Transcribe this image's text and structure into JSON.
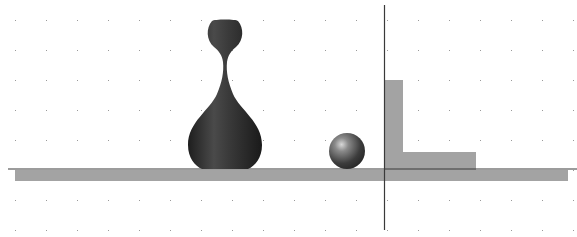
{
  "scene": {
    "title": "3D render viewport: vase and sphere on ground plane",
    "background": "#ffffff",
    "grid": {
      "dot_color": "#9a9a9a",
      "x_spacing": 31,
      "y_spacing": 30,
      "x_start": 15,
      "y_start": 20
    },
    "ground_line": {
      "y": 169,
      "x_start": 8,
      "x_end": 577,
      "color": "#3a3a3a"
    },
    "ground_shadow": {
      "x": 15,
      "y": 170,
      "width": 553,
      "height": 11,
      "color": "#a3a3a3"
    },
    "vertical_axis": {
      "x": 384,
      "y_start": 5,
      "y_end": 230,
      "color": "#3a3a3a"
    },
    "wall_shadow": {
      "color": "#a3a3a3"
    },
    "objects": [
      {
        "name": "vase",
        "color": "#2e2e2e"
      },
      {
        "name": "sphere",
        "cx": 347,
        "cy": 151,
        "r": 18,
        "color": "#4a4a4a"
      }
    ]
  }
}
